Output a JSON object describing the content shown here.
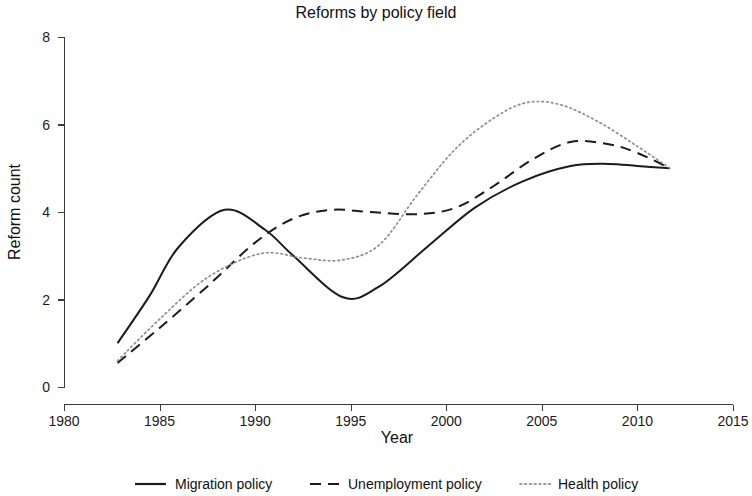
{
  "chart_data": {
    "type": "line",
    "title": "Reforms by policy field",
    "xlabel": "Year",
    "ylabel": "Reform count",
    "xlim": [
      1980,
      2015
    ],
    "ylim": [
      0,
      8
    ],
    "xticks": [
      1980,
      1985,
      1990,
      1995,
      2000,
      2005,
      2010,
      2015
    ],
    "yticks": [
      0,
      2,
      4,
      6,
      8
    ],
    "grid": false,
    "legend_position": "bottom",
    "line_color": "#1b1b1b",
    "dotted_color": "#8d8d8d",
    "series": [
      {
        "name": "Migration policy",
        "style": "solid",
        "x": [
          1982.8,
          1984.5,
          1986.0,
          1988.4,
          1990.5,
          1992.0,
          1994.6,
          1996.5,
          1999.0,
          2001.5,
          2004.0,
          2006.5,
          2008.5,
          2010.0,
          2011.7
        ],
        "values": [
          1.0,
          2.1,
          3.2,
          4.05,
          3.6,
          3.0,
          2.05,
          2.3,
          3.2,
          4.1,
          4.7,
          5.05,
          5.1,
          5.05,
          5.0
        ]
      },
      {
        "name": "Unemployment policy",
        "style": "dashed",
        "x": [
          1982.8,
          1985.0,
          1987.5,
          1990.0,
          1992.0,
          1994.0,
          1996.0,
          1998.5,
          2000.5,
          2002.5,
          2004.5,
          2006.5,
          2008.5,
          2010.0,
          2011.7
        ],
        "values": [
          0.55,
          1.35,
          2.3,
          3.3,
          3.85,
          4.05,
          4.0,
          3.95,
          4.1,
          4.6,
          5.2,
          5.6,
          5.55,
          5.35,
          5.0
        ]
      },
      {
        "name": "Health policy",
        "style": "dotted",
        "x": [
          1982.8,
          1985.0,
          1987.5,
          1990.3,
          1992.5,
          1994.5,
          1996.5,
          1998.5,
          2000.5,
          2002.5,
          2004.2,
          2006.0,
          2008.0,
          2010.0,
          2011.7
        ],
        "values": [
          0.6,
          1.55,
          2.5,
          3.05,
          2.95,
          2.9,
          3.25,
          4.4,
          5.45,
          6.15,
          6.5,
          6.45,
          6.05,
          5.5,
          5.0
        ]
      }
    ],
    "legend": [
      {
        "label": "Migration policy",
        "style": "solid"
      },
      {
        "label": "Unemployment policy",
        "style": "dashed"
      },
      {
        "label": "Health policy",
        "style": "dotted"
      }
    ]
  }
}
